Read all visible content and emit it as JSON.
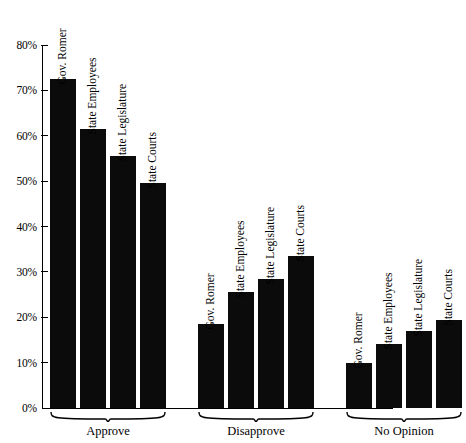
{
  "chart_data": {
    "type": "bar",
    "title": "",
    "subtitle": "",
    "xlabel": "",
    "ylabel": "",
    "ylim": [
      0,
      80
    ],
    "ytick_values": [
      80,
      70,
      60,
      50,
      40,
      30,
      20,
      10,
      0
    ],
    "ytick_labels": [
      "80%",
      "70%",
      "60%",
      "50%",
      "40%",
      "30%",
      "20%",
      "10%",
      "0%"
    ],
    "grid": false,
    "legend": "none",
    "categories": [
      "Approve",
      "Disapprove",
      "No Opinion"
    ],
    "series": [
      {
        "name": "Gov. Romer",
        "values": [
          72.5,
          18.5,
          10.0
        ]
      },
      {
        "name": "State Employees",
        "values": [
          61.5,
          25.5,
          14.0
        ]
      },
      {
        "name": "State Legislature",
        "values": [
          55.5,
          28.5,
          17.0
        ]
      },
      {
        "name": "State Courts",
        "values": [
          49.5,
          33.5,
          19.5
        ]
      }
    ],
    "bar_color": "#0b0b0b",
    "groups": [
      {
        "label": "Approve",
        "bars": [
          {
            "label": "Gov. Romer",
            "value": 72.5
          },
          {
            "label": "State Employees",
            "value": 61.5
          },
          {
            "label": "State Legislature",
            "value": 55.5
          },
          {
            "label": "State Courts",
            "value": 49.5
          }
        ]
      },
      {
        "label": "Disapprove",
        "bars": [
          {
            "label": "Gov. Romer",
            "value": 18.5
          },
          {
            "label": "State Employees",
            "value": 25.5
          },
          {
            "label": "State Legislature",
            "value": 28.5
          },
          {
            "label": "State Courts",
            "value": 33.5
          }
        ]
      },
      {
        "label": "No Opinion",
        "bars": [
          {
            "label": "Gov. Romer",
            "value": 10.0
          },
          {
            "label": "State Employees",
            "value": 14.0
          },
          {
            "label": "State Legislature",
            "value": 17.0
          },
          {
            "label": "State Courts",
            "value": 19.5
          }
        ]
      }
    ]
  },
  "axis": {
    "y_ticks": [
      {
        "label": "80%",
        "value": 80
      },
      {
        "label": "70%",
        "value": 70
      },
      {
        "label": "60%",
        "value": 60
      },
      {
        "label": "50%",
        "value": 50
      },
      {
        "label": "40%",
        "value": 40
      },
      {
        "label": "30%",
        "value": 30
      },
      {
        "label": "20%",
        "value": 20
      },
      {
        "label": "10%",
        "value": 10
      },
      {
        "label": "0%",
        "value": 0
      }
    ]
  }
}
